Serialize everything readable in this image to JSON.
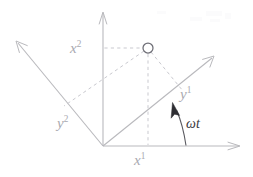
{
  "figure": {
    "background_color": "#ffffff",
    "width": 253,
    "height": 177,
    "colors": {
      "axis": "#b9b9bd",
      "dashed": "#c9c9cf",
      "label": "#a9a9b0",
      "angle_label": "#3a3a40",
      "marker_stroke": "#6e6e76",
      "marker_fill": "#ffffff",
      "arc": "#5a5a60"
    },
    "origin": {
      "x": 103,
      "y": 146
    },
    "point": {
      "x": 148,
      "y": 48,
      "radius": 5
    }
  },
  "labels": {
    "x_axis_horizontal": {
      "base": "x",
      "sup": "1"
    },
    "x_axis_vertical": {
      "base": "x",
      "sup": "2"
    },
    "y_axis_rotated_first": {
      "base": "y",
      "sup": "1"
    },
    "y_axis_rotated_second": {
      "base": "y",
      "sup": "2"
    },
    "angle": "ωt"
  },
  "axes": [
    {
      "name": "x1-axis",
      "label": "x1",
      "from": {
        "x": 103,
        "y": 146
      },
      "to": {
        "x": 240,
        "y": 146
      },
      "arrow": true
    },
    {
      "name": "x2-axis",
      "label": "x2",
      "from": {
        "x": 103,
        "y": 146
      },
      "to": {
        "x": 103,
        "y": 12
      },
      "arrow": true
    },
    {
      "name": "y1-axis",
      "label": "y1",
      "from": {
        "x": 103,
        "y": 146
      },
      "to": {
        "x": 214,
        "y": 56
      },
      "arrow": true
    },
    {
      "name": "y2-axis",
      "label": "y2",
      "from": {
        "x": 103,
        "y": 146
      },
      "to": {
        "x": 16,
        "y": 41
      },
      "arrow": true
    }
  ],
  "projection_lines": [
    {
      "name": "projection-to-x2",
      "from": {
        "x": 148,
        "y": 48
      },
      "to": {
        "x": 103,
        "y": 48
      }
    },
    {
      "name": "projection-to-x1",
      "from": {
        "x": 148,
        "y": 48
      },
      "to": {
        "x": 148,
        "y": 146
      }
    },
    {
      "name": "projection-to-y1",
      "from": {
        "x": 148,
        "y": 48
      },
      "to": {
        "x": 182,
        "y": 90
      }
    },
    {
      "name": "projection-to-y2",
      "from": {
        "x": 148,
        "y": 48
      },
      "to": {
        "x": 64,
        "y": 106
      }
    }
  ],
  "angle_arc": {
    "name": "omega-t-arc",
    "center": {
      "x": 103,
      "y": 146
    },
    "radius": 83,
    "start_deg": 0,
    "end_deg": 39,
    "direction": "counterclockwise",
    "arrow_at_end": true
  }
}
